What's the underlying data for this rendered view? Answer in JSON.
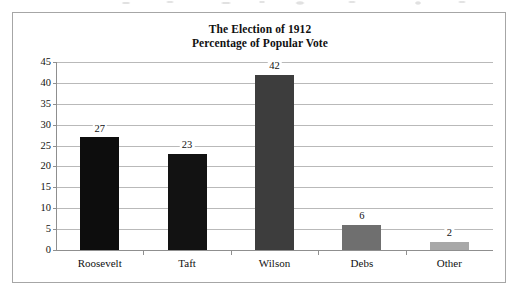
{
  "chart_data": {
    "type": "bar",
    "title": "The Election of 1912\nPercentage of Popular Vote",
    "title_lines": [
      "The Election of 1912",
      "Percentage of Popular Vote"
    ],
    "xlabel": "",
    "ylabel": "",
    "categories": [
      "Roosevelt",
      "Taft",
      "Wilson",
      "Debs",
      "Other"
    ],
    "values": [
      27,
      23,
      42,
      6,
      2
    ],
    "value_labels": [
      "27",
      "23",
      "42",
      "6",
      "2"
    ],
    "ylim": [
      0,
      45
    ],
    "ytick_step": 5,
    "ytick_labels": [
      "0",
      "5",
      "10",
      "15",
      "20",
      "25",
      "30",
      "35",
      "40",
      "45"
    ],
    "grid": true,
    "legend": "none",
    "bar_colors": [
      "#0d0d0d",
      "#121212",
      "#3d3d3d",
      "#6f6f6f",
      "#a8a8a8"
    ],
    "gridline_color": "#b9b9b9",
    "axis_color": "#8f8f8f",
    "border_color": "#a6a6a6",
    "background_color": "#ffffff"
  }
}
